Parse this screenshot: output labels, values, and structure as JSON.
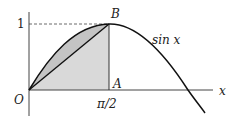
{
  "figure": {
    "labels": {
      "origin": "O",
      "point_a": "A",
      "point_b": "B",
      "y_tick": "1",
      "x_tick": "π/2",
      "x_axis": "x",
      "curve": "sin x"
    },
    "colors": {
      "line": "#222222",
      "shade": "#d9d9d9",
      "background": "#ffffff"
    }
  }
}
